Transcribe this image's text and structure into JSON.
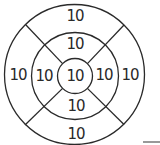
{
  "diagram": {
    "type": "target",
    "rings": [
      "inner",
      "middle",
      "outer"
    ],
    "regions": {
      "center": "10",
      "middle_top": "10",
      "middle_right": "10",
      "middle_bottom": "10",
      "middle_left": "10",
      "outer_top": "10",
      "outer_right": "10",
      "outer_bottom": "10",
      "outer_left": "10"
    },
    "colors": {
      "stroke": "#2a2a2a",
      "background": "#ffffff"
    }
  }
}
